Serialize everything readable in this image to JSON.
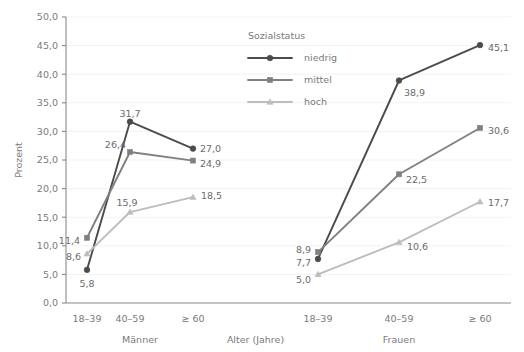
{
  "chart_data": {
    "type": "line",
    "title": "",
    "xlabel": "Alter (Jahre)",
    "ylabel": "Prozent",
    "ylim": [
      0,
      50
    ],
    "ytick_step": 5,
    "grid": true,
    "grid_orientation": "horizontal",
    "legend_title": "Sozialstatus",
    "legend_position": "inside-top-center-right",
    "ytick_labels": [
      "0,0",
      "5,0",
      "10,0",
      "15,0",
      "20,0",
      "25,0",
      "30,0",
      "35,0",
      "40,0",
      "45,0",
      "50,0"
    ],
    "ytick_values": [
      0,
      5,
      10,
      15,
      20,
      25,
      30,
      35,
      40,
      45,
      50
    ],
    "categories": [
      "18–39",
      "40–59",
      "≥ 60",
      "18–39",
      "40–59",
      "≥ 60"
    ],
    "groups": [
      {
        "label": "Männer",
        "categories": [
          "18–39",
          "40–59",
          "≥ 60"
        ]
      },
      {
        "label": "Frauen",
        "categories": [
          "18–39",
          "40–59",
          "≥ 60"
        ]
      }
    ],
    "series": [
      {
        "name": "niedrig",
        "marker": "circle",
        "color": "#4b4b4b",
        "values": [
          5.8,
          31.7,
          27.0,
          7.7,
          38.9,
          45.1
        ],
        "labels": [
          "5,8",
          "31,7",
          "27,0",
          "7,7",
          "38,9",
          "45,1"
        ]
      },
      {
        "name": "mittel",
        "marker": "square",
        "color": "#808080",
        "values": [
          11.4,
          26.4,
          24.9,
          8.9,
          22.5,
          30.6
        ],
        "labels": [
          "11,4",
          "26,4",
          "24,9",
          "8,9",
          "22,5",
          "30,6"
        ]
      },
      {
        "name": "hoch",
        "marker": "triangle",
        "color": "#bdbdbd",
        "values": [
          8.6,
          15.9,
          18.5,
          5.0,
          10.6,
          17.7
        ],
        "labels": [
          "8,6",
          "15,9",
          "18,5",
          "5,0",
          "10,6",
          "17,7"
        ]
      }
    ],
    "point_labels": [
      {
        "series": "niedrig",
        "index": 0,
        "text": "5,8",
        "anchor": "middle",
        "dx": 0,
        "dy": 14
      },
      {
        "series": "niedrig",
        "index": 1,
        "text": "31,7",
        "anchor": "middle",
        "dx": 0,
        "dy": -8
      },
      {
        "series": "niedrig",
        "index": 2,
        "text": "27,0",
        "anchor": "start",
        "dx": 7,
        "dy": 0
      },
      {
        "series": "niedrig",
        "index": 3,
        "text": "7,7",
        "anchor": "end",
        "dx": -7,
        "dy": 4
      },
      {
        "series": "niedrig",
        "index": 4,
        "text": "38,9",
        "anchor": "start",
        "dx": 5,
        "dy": 12
      },
      {
        "series": "niedrig",
        "index": 5,
        "text": "45,1",
        "anchor": "start",
        "dx": 8,
        "dy": 3
      },
      {
        "series": "mittel",
        "index": 0,
        "text": "11,4",
        "anchor": "end",
        "dx": -7,
        "dy": 3
      },
      {
        "series": "mittel",
        "index": 1,
        "text": "26,4",
        "anchor": "end",
        "dx": -4,
        "dy": -7
      },
      {
        "series": "mittel",
        "index": 2,
        "text": "24,9",
        "anchor": "start",
        "dx": 7,
        "dy": 3
      },
      {
        "series": "mittel",
        "index": 3,
        "text": "8,9",
        "anchor": "end",
        "dx": -7,
        "dy": -2
      },
      {
        "series": "mittel",
        "index": 4,
        "text": "22,5",
        "anchor": "start",
        "dx": 7,
        "dy": 5
      },
      {
        "series": "mittel",
        "index": 5,
        "text": "30,6",
        "anchor": "start",
        "dx": 8,
        "dy": 3
      },
      {
        "series": "hoch",
        "index": 0,
        "text": "8,6",
        "anchor": "end",
        "dx": -6,
        "dy": 3
      },
      {
        "series": "hoch",
        "index": 1,
        "text": "15,9",
        "anchor": "middle",
        "dx": -3,
        "dy": -9
      },
      {
        "series": "hoch",
        "index": 2,
        "text": "18,5",
        "anchor": "start",
        "dx": 8,
        "dy": -1
      },
      {
        "series": "hoch",
        "index": 3,
        "text": "5,0",
        "anchor": "end",
        "dx": -7,
        "dy": 5
      },
      {
        "series": "hoch",
        "index": 4,
        "text": "10,6",
        "anchor": "start",
        "dx": 8,
        "dy": 4
      },
      {
        "series": "hoch",
        "index": 5,
        "text": "17,7",
        "anchor": "start",
        "dx": 8,
        "dy": 1
      }
    ],
    "colors": {
      "niedrig": "#4b4b4b",
      "mittel": "#808080",
      "hoch": "#bdbdbd",
      "axis": "#8a8a8a",
      "grid": "#f2f2f2",
      "text": "#7a7a7a",
      "background": "#ffffff"
    }
  }
}
